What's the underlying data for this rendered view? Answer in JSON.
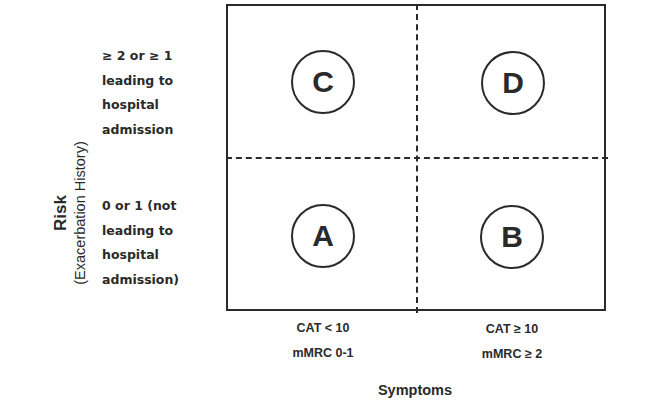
{
  "y_axis": {
    "title": "Risk",
    "subtitle": "(Exacerbation History)",
    "levels": [
      {
        "lines": [
          "≥ 2 or ≥ 1",
          "leading to",
          "hospital",
          "admission"
        ]
      },
      {
        "lines": [
          "0 or 1 (not",
          "leading to",
          "hospital",
          "admission)"
        ]
      }
    ]
  },
  "x_axis": {
    "title": "Symptoms",
    "levels": [
      {
        "line1": "CAT < 10",
        "line2": "mMRC 0-1"
      },
      {
        "line1": "CAT ≥ 10",
        "line2": "mMRC ≥ 2"
      }
    ]
  },
  "quadrants": {
    "top_left": "C",
    "top_right": "D",
    "bottom_left": "A",
    "bottom_right": "B"
  }
}
